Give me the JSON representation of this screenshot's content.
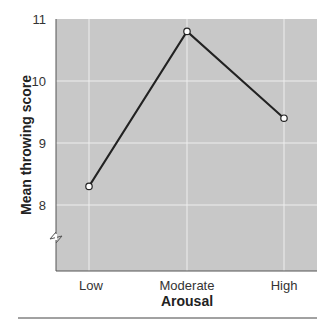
{
  "chart_data": {
    "type": "line",
    "title": "",
    "xlabel": "Arousal",
    "ylabel": "Mean throwing score",
    "categories": [
      "Low",
      "Moderate",
      "High"
    ],
    "series": [
      {
        "name": "Mean throwing score",
        "values": [
          8.3,
          10.8,
          9.4
        ]
      }
    ],
    "yticks": [
      "8",
      "9",
      "10",
      "11"
    ],
    "ylim": [
      7,
      11
    ],
    "grid": true,
    "legend": "none",
    "y_axis_break": true
  },
  "colors": {
    "plot_background": "#c8c8c8",
    "gridline": "#eeeeee",
    "line": "#222222",
    "marker_fill": "#ffffff"
  }
}
